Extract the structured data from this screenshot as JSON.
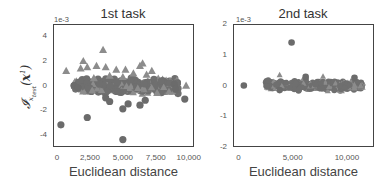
{
  "chart_data": [
    {
      "type": "scatter",
      "title": "1st task",
      "xlabel": "Euclidean distance",
      "ylabel": "I_{x_test^1}(x^1)",
      "y_scale_label": "1e-3",
      "xlim": [
        -300,
        10400
      ],
      "ylim": [
        -5,
        5
      ],
      "xticks": [
        "0",
        "2,500",
        "5,000",
        "7,500",
        "10,000"
      ],
      "yticks": [
        "4",
        "2",
        "0",
        "-2",
        "-4"
      ],
      "series": [
        {
          "name": "triangles",
          "marker": "triangle",
          "color": "#8c8c8c",
          "points": [
            [
              700,
              1.2
            ],
            [
              2000,
              2.0
            ],
            [
              2300,
              1.5
            ],
            [
              1800,
              1.4
            ],
            [
              3500,
              2.9
            ],
            [
              3700,
              1.5
            ],
            [
              3000,
              1.6
            ],
            [
              4500,
              1.3
            ],
            [
              5200,
              1.3
            ],
            [
              6300,
              1.6
            ],
            [
              6500,
              1.8
            ],
            [
              7200,
              1.2
            ],
            [
              5800,
              1.0
            ],
            [
              9800,
              0.0
            ],
            [
              8500,
              -0.5
            ],
            [
              5000,
              0.7
            ],
            [
              4000,
              0.8
            ],
            [
              6800,
              0.9
            ],
            [
              2800,
              0.6
            ],
            [
              7600,
              -0.6
            ]
          ]
        },
        {
          "name": "circles",
          "marker": "circle",
          "color": "#6b6b6b",
          "points": [
            [
              300,
              -3.2
            ],
            [
              2300,
              -2.6
            ],
            [
              5000,
              -4.4
            ],
            [
              9700,
              -1.1
            ],
            [
              1300,
              0.0
            ],
            [
              1600,
              -0.2
            ],
            [
              3700,
              -1.0
            ],
            [
              4000,
              -1.3
            ],
            [
              5000,
              -1.9
            ],
            [
              5400,
              -1.5
            ],
            [
              6300,
              -1.6
            ],
            [
              6700,
              -1.2
            ],
            [
              8900,
              0.1
            ],
            [
              9000,
              -0.3
            ]
          ]
        }
      ],
      "dense_band": {
        "x_range": [
          1300,
          9200
        ],
        "y_range": [
          -0.8,
          0.8
        ]
      }
    },
    {
      "type": "scatter",
      "title": "2nd task",
      "xlabel": "Euclidean distance",
      "y_scale_label": "1e-3",
      "xlim": [
        -500,
        12500
      ],
      "ylim": [
        -2,
        2
      ],
      "xticks": [
        "0",
        "5,000",
        "10,000"
      ],
      "yticks": [
        "2",
        "1",
        "0",
        "-1",
        "-2"
      ],
      "series": [
        {
          "name": "triangles",
          "marker": "triangle",
          "color": "#8c8c8c",
          "points": [
            [
              3800,
              0.35
            ],
            [
              7800,
              0.3
            ]
          ]
        },
        {
          "name": "circles",
          "marker": "circle",
          "color": "#6b6b6b",
          "points": [
            [
              500,
              0.0
            ],
            [
              4900,
              1.4
            ],
            [
              6200,
              0.28
            ],
            [
              10700,
              0.25
            ],
            [
              3800,
              -0.15
            ]
          ]
        }
      ],
      "dense_band": {
        "x_range": [
          2500,
          11500
        ],
        "y_range": [
          -0.2,
          0.2
        ]
      }
    }
  ],
  "left": {
    "title": "1st task",
    "xlabel": "Euclidean distance",
    "exp": "1e-3",
    "yticks": [
      {
        "t": "4",
        "y": 4
      },
      {
        "t": "2",
        "y": 2
      },
      {
        "t": "0",
        "y": 0
      },
      {
        "t": "-2",
        "y": -2
      },
      {
        "t": "-4",
        "y": -4
      }
    ],
    "xticks": [
      {
        "t": "0",
        "x": 0
      },
      {
        "t": "2,500",
        "x": 2500
      },
      {
        "t": "5,000",
        "x": 5000
      },
      {
        "t": "7,500",
        "x": 7500
      },
      {
        "t": "10,000",
        "x": 10000
      }
    ]
  },
  "right": {
    "title": "2nd task",
    "xlabel": "Euclidean distance",
    "exp": "1e-3",
    "yticks": [
      {
        "t": "2",
        "y": 2
      },
      {
        "t": "1",
        "y": 1
      },
      {
        "t": "0",
        "y": 0
      },
      {
        "t": "-1",
        "y": -1
      },
      {
        "t": "-2",
        "y": -2
      }
    ],
    "xticks": [
      {
        "t": "0",
        "x": 0
      },
      {
        "t": "5,000",
        "x": 5000
      },
      {
        "t": "10,000",
        "x": 10000
      }
    ]
  }
}
